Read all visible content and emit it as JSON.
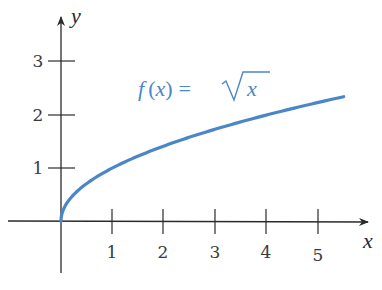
{
  "chart_data": {
    "type": "line",
    "title": "",
    "xlabel": "x",
    "ylabel": "y",
    "xlim": [
      -1.0,
      6.0
    ],
    "ylim": [
      -1.0,
      3.6
    ],
    "grid": false,
    "x_ticks": [
      "1",
      "2",
      "3",
      "4",
      "5"
    ],
    "y_ticks": [
      "1",
      "2",
      "3"
    ],
    "series": [
      {
        "name": "f(x) = √x",
        "color": "#4a86c8",
        "x": [
          0,
          0.05,
          0.1,
          0.25,
          0.5,
          1,
          1.5,
          2,
          2.5,
          3,
          3.5,
          4,
          4.5,
          5,
          5.5
        ],
        "values": [
          0,
          0.224,
          0.316,
          0.5,
          0.707,
          1,
          1.225,
          1.414,
          1.581,
          1.732,
          1.871,
          2,
          2.121,
          2.236,
          2.345
        ]
      }
    ],
    "annotations": [
      {
        "text": "f (x) = √x",
        "x": 2.5,
        "y": 2.5,
        "color": "#4a86c8"
      }
    ]
  },
  "labels": {
    "x_axis": "x",
    "y_axis": "y",
    "formula_f": "f",
    "formula_open": "(",
    "formula_x": "x",
    "formula_close": ")",
    "formula_eq": "=",
    "formula_rad_x": "x"
  },
  "colors": {
    "curve": "#4a86c8",
    "axis": "#2a2a2a"
  }
}
